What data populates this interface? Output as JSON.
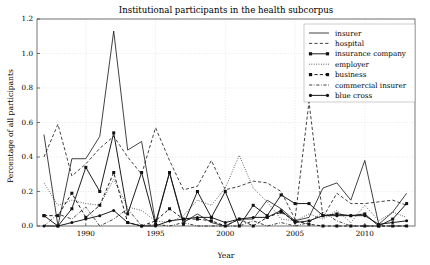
{
  "chart_data": {
    "type": "line",
    "title": "Institutional participants in the health subcorpus",
    "xlabel": "Year",
    "ylabel": "Percentage of all participants",
    "xlim": [
      1986.5,
      2013.6
    ],
    "ylim": [
      0.0,
      1.2
    ],
    "xticks": [
      1990,
      1995,
      2000,
      2005,
      2010
    ],
    "xticklabels": [
      "1990",
      "1995",
      "2000",
      "2005",
      "2010"
    ],
    "yticks": [
      0.0,
      0.2,
      0.4,
      0.6,
      0.8,
      1.0,
      1.2
    ],
    "yticklabels": [
      "0.0",
      "0.2",
      "0.4",
      "0.6",
      "0.8",
      "1.0",
      "1.2"
    ],
    "grid": true,
    "legend_position": "upper right",
    "x": [
      1987,
      1988,
      1989,
      1990,
      1991,
      1992,
      1993,
      1994,
      1995,
      1996,
      1997,
      1998,
      1999,
      2000,
      2001,
      2002,
      2003,
      2004,
      2005,
      2006,
      2007,
      2008,
      2009,
      2010,
      2011,
      2012,
      2013
    ],
    "series": [
      {
        "name": "insurer",
        "style": "solid",
        "marker": "none",
        "values": [
          0.53,
          0.0,
          0.39,
          0.39,
          0.52,
          1.13,
          0.44,
          0.49,
          0.02,
          0.31,
          0.02,
          0.07,
          0.02,
          0.0,
          0.04,
          0.04,
          0.15,
          0.1,
          0.03,
          0.05,
          0.22,
          0.25,
          0.15,
          0.38,
          0.01,
          0.08,
          0.19
        ]
      },
      {
        "name": "hospital",
        "style": "dashed",
        "marker": "none",
        "values": [
          0.4,
          0.59,
          0.29,
          0.36,
          0.45,
          0.52,
          0.4,
          0.3,
          0.57,
          0.38,
          0.21,
          0.23,
          0.38,
          0.21,
          0.23,
          0.26,
          0.25,
          0.2,
          0.04,
          0.72,
          0.05,
          0.19,
          0.13,
          0.13,
          0.14,
          0.15,
          0.12
        ]
      },
      {
        "name": "insurance company",
        "style": "solid",
        "marker": "square",
        "values": [
          0.06,
          0.0,
          0.1,
          0.34,
          0.2,
          0.54,
          0.07,
          0.31,
          0.01,
          0.31,
          0.01,
          0.2,
          0.05,
          0.2,
          0.0,
          0.12,
          0.06,
          0.18,
          0.13,
          0.13,
          0.06,
          0.07,
          0.06,
          0.07,
          0.0,
          0.04,
          0.13
        ]
      },
      {
        "name": "employer",
        "style": "dotted",
        "marker": "none",
        "values": [
          0.25,
          0.12,
          0.15,
          0.13,
          0.12,
          0.27,
          0.11,
          0.09,
          0.03,
          0.02,
          0.06,
          0.15,
          0.12,
          0.22,
          0.41,
          0.22,
          0.14,
          0.04,
          0.03,
          0.07,
          0.04,
          0.09,
          0.02,
          0.12,
          0.03,
          0.08,
          0.05
        ]
      },
      {
        "name": "business",
        "style": "dashed",
        "marker": "square",
        "values": [
          0.06,
          0.06,
          0.19,
          0.05,
          0.12,
          0.31,
          0.02,
          0.0,
          0.03,
          0.1,
          0.04,
          0.04,
          0.03,
          0.0,
          0.04,
          0.0,
          0.05,
          0.08,
          0.03,
          0.01,
          0.0,
          0.0,
          0.0,
          0.0,
          0.0,
          0.0,
          0.0
        ]
      },
      {
        "name": "commercial insurer",
        "style": "dashdot",
        "marker": "none",
        "values": [
          0.0,
          0.07,
          0.04,
          0.11,
          0.0,
          0.04,
          0.1,
          0.0,
          0.01,
          0.0,
          0.02,
          0.0,
          0.0,
          0.0,
          0.0,
          0.03,
          0.0,
          0.02,
          0.0,
          0.02,
          0.08,
          0.03,
          0.0,
          0.0,
          0.0,
          0.0,
          0.0
        ]
      },
      {
        "name": "blue cross",
        "style": "solid",
        "marker": "circle",
        "values": [
          0.0,
          0.0,
          0.02,
          0.04,
          0.06,
          0.09,
          0.02,
          0.0,
          0.0,
          0.03,
          0.04,
          0.05,
          0.05,
          0.02,
          0.04,
          0.05,
          0.05,
          0.09,
          0.02,
          0.03,
          0.06,
          0.06,
          0.06,
          0.06,
          0.01,
          0.02,
          0.03
        ]
      }
    ]
  },
  "colors": {
    "line": "#111111",
    "grid": "#cfcfcf",
    "frame": "#3a3a3a",
    "background": "#ffffff"
  }
}
